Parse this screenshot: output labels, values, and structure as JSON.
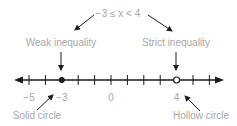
{
  "diagram": {
    "expression": "−3 ≤ x < 4",
    "labels": {
      "weak": "Weak inequality",
      "strict": "Strict inequality",
      "solid": "Solid circle",
      "hollow": "Hollow circle"
    },
    "number_line": {
      "min_tick": -5,
      "max_tick": 6,
      "tick_labels": [
        {
          "value": -5,
          "text": "−5"
        },
        {
          "value": -3,
          "text": "−3"
        },
        {
          "value": 0,
          "text": "0"
        },
        {
          "value": 4,
          "text": "4"
        }
      ],
      "solid_point": -3,
      "hollow_point": 4
    },
    "colors": {
      "text": "#a6a6a6",
      "ink": "#1a1a1a"
    }
  }
}
